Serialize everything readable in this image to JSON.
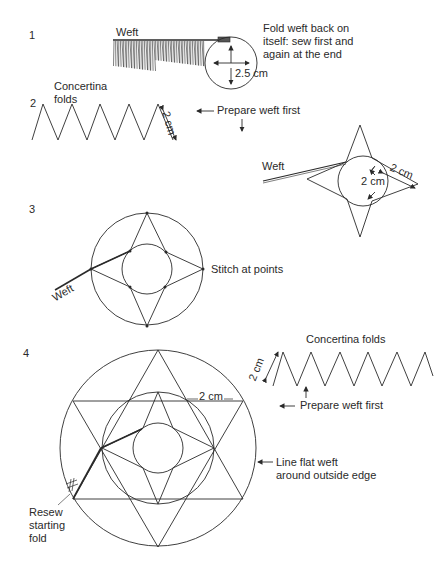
{
  "steps": [
    {
      "number": "1",
      "weft_label": "Weft",
      "instruction": "Fold weft back on\nitself: sew first and\nagain at the end",
      "measure": "2.5 cm"
    },
    {
      "number": "2",
      "folds_label": "Concertina\nfolds",
      "fold_measure": "2 cm",
      "prepare_label": "Prepare weft first",
      "weft_label": "Weft",
      "circle_measure": "2 cm",
      "edge_measure": "2 cm"
    },
    {
      "number": "3",
      "weft_label": "Weft",
      "stitch_label": "Stitch at points"
    },
    {
      "number": "4",
      "folds_label": "Concertina folds",
      "fold_measure": "2 cm",
      "prepare_label": "Prepare weft first",
      "gap_measure": "2 cm",
      "edge_label": "Line flat weft\naround outside edge",
      "resew_label": "Resew\nstarting\nfold"
    }
  ],
  "colors": {
    "line": "#2a2a2a",
    "background": "#ffffff"
  }
}
